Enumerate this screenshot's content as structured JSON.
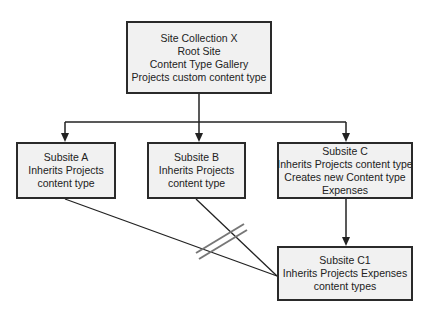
{
  "diagram": {
    "type": "hierarchy",
    "colors": {
      "box_fill": "#f1f1f1",
      "box_border": "#2a2a2a",
      "line": "#222222",
      "break_mark": "#777777"
    },
    "nodes": {
      "root": {
        "lines": [
          "Site Collection X",
          "Root Site",
          "Content Type Gallery",
          "Projects custom content type"
        ]
      },
      "subsite_a": {
        "lines": [
          "Subsite A",
          "Inherits Projects",
          "content type"
        ]
      },
      "subsite_b": {
        "lines": [
          "Subsite B",
          "Inherits Projects",
          "content type"
        ]
      },
      "subsite_c": {
        "lines": [
          "Subsite C",
          "Inherits Projects content type",
          "Creates new Content type",
          "Expenses"
        ]
      },
      "subsite_c1": {
        "lines": [
          "Subsite C1",
          "Inherits Projects Expenses",
          "content types"
        ]
      }
    },
    "edges": [
      {
        "from": "root",
        "to": "subsite_a",
        "style": "arrow"
      },
      {
        "from": "root",
        "to": "subsite_b",
        "style": "arrow"
      },
      {
        "from": "root",
        "to": "subsite_c",
        "style": "arrow"
      },
      {
        "from": "subsite_c",
        "to": "subsite_c1",
        "style": "arrow"
      },
      {
        "from": "subsite_a",
        "to": "subsite_c1",
        "style": "blocked-line"
      },
      {
        "from": "subsite_b",
        "to": "subsite_c1",
        "style": "blocked-line"
      }
    ],
    "break_mark": {
      "description": "double-slash across lines from Subsite A and B to Subsite C1"
    }
  }
}
